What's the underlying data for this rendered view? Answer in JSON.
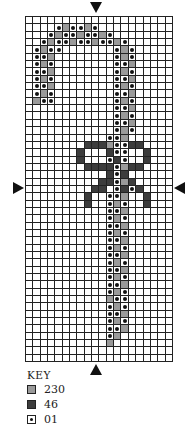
{
  "chart": {
    "columns": 20,
    "rows": 47,
    "legend_codes": {
      ".": "empty",
      "g": "230",
      "d": "46",
      "o": "01"
    },
    "pattern": [
      "....................",
      "....ogoogo..........",
      "...ogoogoogo........",
      "..ogoogoogoogo......",
      ".ogoo.......ogo.....",
      ".oog........ogo.....",
      ".ogo........oog.....",
      ".oog........ogo.....",
      ".ogo........oog.....",
      ".oog........ogo.....",
      ".ogo........oog.....",
      ".goo........ogo.....",
      "............oog.....",
      "............ogo.....",
      "............oog.....",
      "............ogo.....",
      "...........oog......",
      "........dddgoodd....",
      ".......d...doo..d...",
      ".......d...odo..d...",
      "........ddddogdd....",
      "...........dod......",
      "..........ddogd.....",
      ".........dd.odod....",
      "........d..oog..d...",
      "........d..ogo..d...",
      "...........oog......",
      "...........ogo......",
      "...........oog......",
      "...........ogo......",
      "...........oog......",
      "...........ogo......",
      "...........oog......",
      "...........ogo......",
      "...........oog......",
      "...........ogo......",
      "...........oog......",
      "...........ogo......",
      "...........goo......",
      "...........ogo......",
      "...........oog......",
      "...........ogo......",
      "...........oog......",
      "...........og.......",
      "...........g........",
      "....................",
      "...................."
    ],
    "center_markers": [
      "top-arrow",
      "bottom-arrow",
      "left-arrow",
      "right-arrow"
    ]
  },
  "key": {
    "title": "KEY",
    "items": [
      {
        "code": "g",
        "label": "230"
      },
      {
        "code": "d",
        "label": "46"
      },
      {
        "code": "o",
        "label": "01"
      }
    ]
  }
}
